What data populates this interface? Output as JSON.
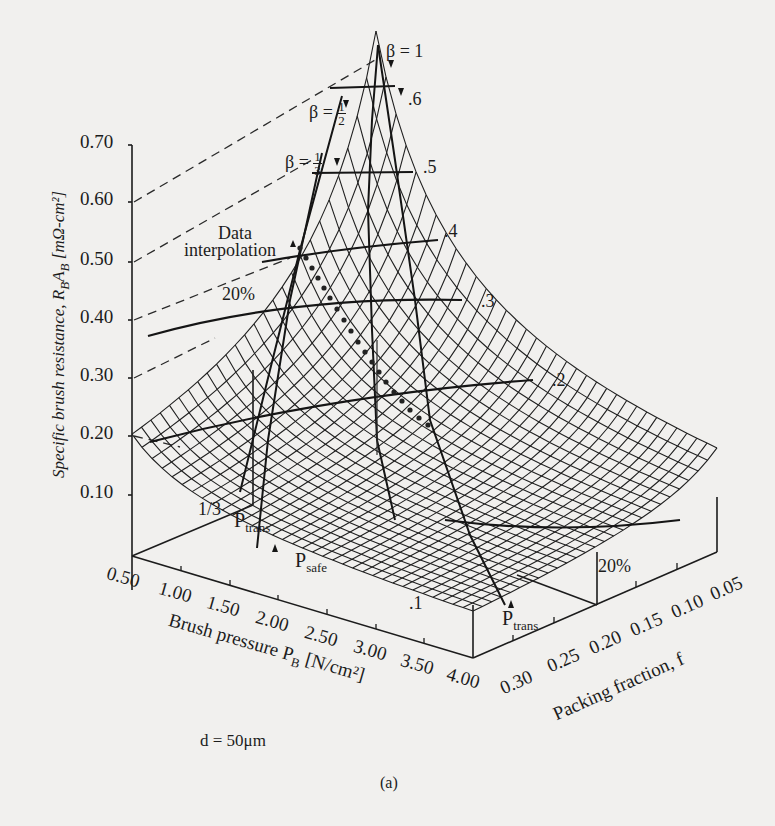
{
  "figure": {
    "panel_label": "(a)",
    "parameter_note": "d = 50μm"
  },
  "y_axis": {
    "label_main": "Specific brush resistance, R",
    "label_sub_B": "B",
    "label_A": "A",
    "label_sub_B2": "B",
    "label_units": " [mΩ-cm²]",
    "ticks": [
      "0.70",
      "0.60",
      "0.50",
      "0.40",
      "0.30",
      "0.20",
      "0.10"
    ]
  },
  "x_axis": {
    "label_main": "Brush pressure P",
    "label_sub": "B",
    "label_units": " [N/cm²]",
    "ticks": [
      "0.50",
      "1.00",
      "1.50",
      "2.00",
      "2.50",
      "3.00",
      "3.50",
      "4.00"
    ]
  },
  "z_axis": {
    "label": "Packing fraction, f",
    "ticks": [
      "0.30",
      "0.25",
      "0.20",
      "0.15",
      "0.10",
      "0.05"
    ]
  },
  "annotations": {
    "beta_1": "β = 1",
    "beta_half_prefix": "β =",
    "beta_half_num": "1",
    "beta_half_den": "2",
    "beta_third_prefix": "β =",
    "beta_third_num": "1",
    "beta_third_den": "3",
    "data_interp_line1": "Data",
    "data_interp_line2": "interpolation",
    "pct_20_left": "20%",
    "pct_20_right": "20%",
    "one_third": "1/3",
    "p_trans_left_main": "P",
    "p_trans_left_sub": "trans",
    "p_safe_main": "P",
    "p_safe_sub": "safe",
    "p_trans_right_main": "P",
    "p_trans_right_sub": "trans",
    "contour_6": ".6",
    "contour_5": ".5",
    "contour_4": ".4",
    "contour_3": ".3",
    "contour_2": ".2",
    "contour_1": ".1"
  },
  "chart_data": {
    "type": "surface3d",
    "title": "",
    "xlabel": "Brush pressure P_B [N/cm²]",
    "ylabel": "Specific brush resistance, R_B A_B [mΩ-cm²]",
    "zlabel": "Packing fraction, f",
    "x_ticks": [
      0.5,
      1.0,
      1.5,
      2.0,
      2.5,
      3.0,
      3.5,
      4.0
    ],
    "z_ticks": [
      0.3,
      0.25,
      0.2,
      0.15,
      0.1,
      0.05
    ],
    "y_ticks": [
      0.1,
      0.2,
      0.3,
      0.4,
      0.5,
      0.6,
      0.7
    ],
    "xlim": [
      0.5,
      4.0
    ],
    "zlim": [
      0.05,
      0.3
    ],
    "ylim": [
      0.0,
      0.7
    ],
    "grid": "wireframe mesh",
    "contour_levels": [
      0.1,
      0.2,
      0.3,
      0.4,
      0.5,
      0.6
    ],
    "beta_curves": [
      "β = 1",
      "β = 1/2",
      "β = 1/3"
    ],
    "marked_curves": [
      "P_trans (1/3)",
      "P_safe",
      "P_trans (20%)",
      "Data interpolation (dotted)"
    ],
    "surface_description": "Resistance peaks (~0.72) at low pressure (0.50) and low packing fraction (0.05); decreases toward ~0.05 at high pressure (4.00) and high packing fraction (0.30).",
    "corner_values": {
      "P0.50_f0.05": 0.72,
      "P0.50_f0.30": 0.26,
      "P4.00_f0.05": 0.1,
      "P4.00_f0.30": 0.05
    },
    "parameter": "d = 50μm",
    "panel": "(a)"
  }
}
